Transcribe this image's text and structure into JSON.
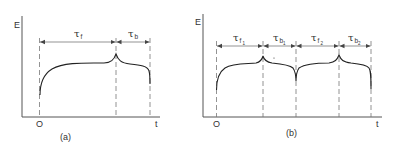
{
  "figure": {
    "panel_a": {
      "y_axis_label": "E",
      "x_axis_label": "t",
      "origin_label": "O",
      "caption": "(a)",
      "intervals": [
        {
          "symbol": "τ",
          "subscript": "f",
          "subsub": ""
        },
        {
          "symbol": "τ",
          "subscript": "b",
          "subsub": ""
        }
      ]
    },
    "panel_b": {
      "y_axis_label": "E",
      "x_axis_label": "t",
      "origin_label": "O",
      "caption": "(b)",
      "intervals": [
        {
          "symbol": "τ",
          "subscript": "f",
          "subsub": "1"
        },
        {
          "symbol": "τ",
          "subscript": "b",
          "subsub": "1"
        },
        {
          "symbol": "τ",
          "subscript": "f",
          "subsub": "2"
        },
        {
          "symbol": "τ",
          "subscript": "b",
          "subsub": "2"
        }
      ]
    }
  }
}
